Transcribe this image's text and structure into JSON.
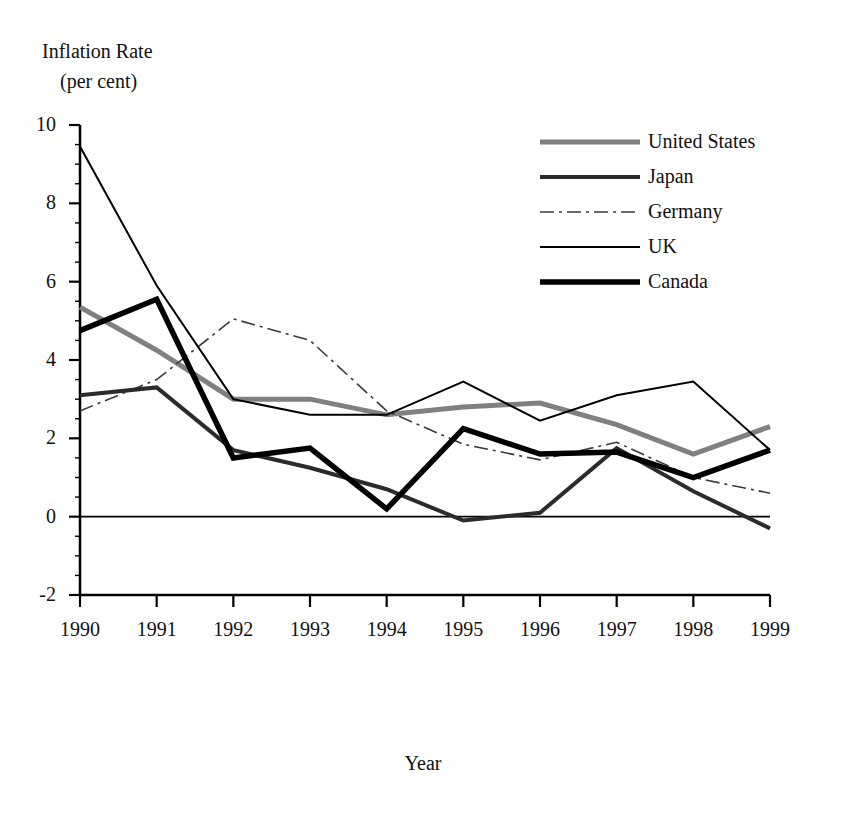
{
  "chart_data": {
    "type": "line",
    "title": "",
    "ylabel_line1": "Inflation Rate",
    "ylabel_line2": "(per cent)",
    "xlabel": "Year",
    "grid": false,
    "legend_position": "top-right",
    "x": [
      "1990",
      "1991",
      "1992",
      "1993",
      "1994",
      "1995",
      "1996",
      "1997",
      "1998",
      "1999"
    ],
    "categories": [
      "1990",
      "1991",
      "1992",
      "1993",
      "1994",
      "1995",
      "1996",
      "1997",
      "1998",
      "1999"
    ],
    "xtick_labels": [
      "1990",
      "1991",
      "1992",
      "1993",
      "1994",
      "1995",
      "1996",
      "1997",
      "1998",
      "1999"
    ],
    "ytick_labels": [
      "10",
      "8",
      "6",
      "4",
      "2",
      "0",
      "-2"
    ],
    "ytick_values": [
      10,
      8,
      6,
      4,
      2,
      0,
      -2
    ],
    "ylim": [
      -2,
      10
    ],
    "xlim": [
      "1990",
      "1999"
    ],
    "zero_line": 0,
    "series": [
      {
        "name": "United States",
        "style": "thick-gray",
        "color": "#808080",
        "width": 5,
        "dash": "",
        "values": [
          5.35,
          4.25,
          3.0,
          3.0,
          2.6,
          2.8,
          2.9,
          2.35,
          1.6,
          2.3
        ]
      },
      {
        "name": "Japan",
        "style": "medium-dark",
        "color": "#2b2b2b",
        "width": 4,
        "dash": "",
        "values": [
          3.1,
          3.3,
          1.7,
          1.25,
          0.7,
          -0.1,
          0.1,
          1.75,
          0.65,
          -0.3
        ]
      },
      {
        "name": "Germany",
        "style": "dash-dot-thin",
        "color": "#3a3a3a",
        "width": 1.6,
        "dash": "14,5,3,5",
        "values": [
          2.7,
          3.5,
          5.05,
          4.5,
          2.7,
          1.85,
          1.45,
          1.9,
          1.0,
          0.6
        ]
      },
      {
        "name": "UK",
        "style": "thin-solid",
        "color": "#000000",
        "width": 2,
        "dash": "",
        "values": [
          9.45,
          5.9,
          3.0,
          2.6,
          2.6,
          3.45,
          2.45,
          3.1,
          3.45,
          1.7
        ]
      },
      {
        "name": "Canada",
        "style": "thick-black",
        "color": "#000000",
        "width": 5.5,
        "dash": "",
        "values": [
          4.75,
          5.55,
          1.5,
          1.75,
          0.2,
          2.25,
          1.6,
          1.65,
          1.0,
          1.7
        ]
      }
    ]
  },
  "legend": {
    "items": [
      {
        "label": "United States"
      },
      {
        "label": "Japan"
      },
      {
        "label": "Germany"
      },
      {
        "label": "UK"
      },
      {
        "label": "Canada"
      }
    ]
  }
}
